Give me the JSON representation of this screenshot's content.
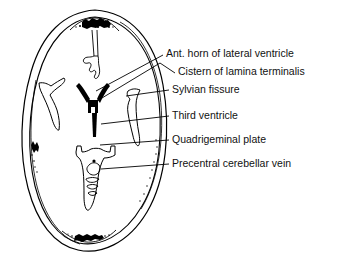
{
  "figure": {
    "kind": "anatomical-line-drawing",
    "view": "axial cranial section",
    "line_color": "#000000",
    "fill_color": "#000000",
    "background_color": "#ffffff"
  },
  "labels": [
    {
      "id": "ant-horn-of-lateral-ventricle",
      "text": "Ant. horn of lateral ventricle",
      "text_x": 166,
      "text_y": 57,
      "leader": "M163,55 L96,91",
      "target": "anterior horns of lateral ventricles"
    },
    {
      "id": "cistern-of-lamina-terminalis",
      "text": "Cistern of lamina terminalis",
      "text_x": 178,
      "text_y": 75,
      "leader": "M175,73 L160,63 L97,101",
      "target": "cistern of lamina terminalis"
    },
    {
      "id": "sylvian-fissure",
      "text": "Sylvian fissure",
      "text_x": 172,
      "text_y": 93,
      "leader": "M169,90 L126,96",
      "target": "sylvian fissure"
    },
    {
      "id": "third-ventricle",
      "text": "Third ventricle",
      "text_x": 172,
      "text_y": 119,
      "leader": "M169,116 L101,124",
      "target": "third ventricle"
    },
    {
      "id": "quadrigeminal-plate",
      "text": "Quadrigeminal plate",
      "text_x": 172,
      "text_y": 143,
      "leader": "M169,140 L100,145",
      "target": "quadrigeminal plate"
    },
    {
      "id": "precentral-cerebellar-vein",
      "text": "Precentral cerebellar vein",
      "text_x": 172,
      "text_y": 167,
      "leader": "M169,164 L101,169",
      "target": "precentral cerebellar vein"
    }
  ],
  "structures": [
    {
      "id": "skull-outer-contour",
      "name": "skull outer contour"
    },
    {
      "id": "skull-inner-contour",
      "name": "skull inner table"
    },
    {
      "id": "superior-sagittal-sinus",
      "name": "superior sagittal sinus (anterior stipple)"
    },
    {
      "id": "interhemispheric-fissure",
      "name": "interhemispheric fissure"
    },
    {
      "id": "anterior-horns",
      "name": "anterior horns of lateral ventricles"
    },
    {
      "id": "cistern-lamina-terminalis",
      "name": "cistern of lamina terminalis"
    },
    {
      "id": "left-sylvian-fissure",
      "name": "left sylvian fissure"
    },
    {
      "id": "right-sylvian-fissure",
      "name": "right sylvian fissure"
    },
    {
      "id": "third-ventricle-slit",
      "name": "third ventricle"
    },
    {
      "id": "quadrigeminal-cistern",
      "name": "quadrigeminal plate cistern"
    },
    {
      "id": "cerebellar-vermis",
      "name": "cerebellar vermis outline"
    },
    {
      "id": "precentral-cerebellar-vein-dot",
      "name": "precentral cerebellar vein"
    },
    {
      "id": "occipital-stipple",
      "name": "occipital stipple / torcular"
    }
  ]
}
